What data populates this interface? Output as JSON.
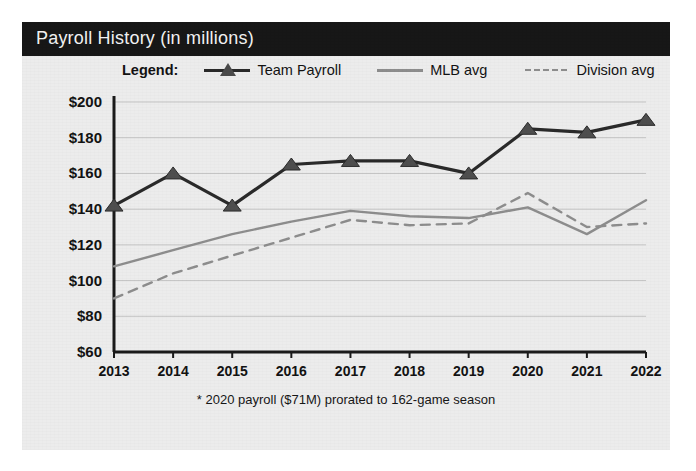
{
  "panel": {
    "title": "Payroll History (in millions)",
    "background_color": "#ececec",
    "title_bar_color": "#171717",
    "title_text_color": "#f2f2f2"
  },
  "legend": {
    "label": "Legend:",
    "items": [
      {
        "name": "Team Payroll",
        "style": "solid-marker",
        "color": "#2a2a2a",
        "marker": "triangle"
      },
      {
        "name": "MLB avg",
        "style": "solid",
        "color": "#8d8d8d",
        "marker": "none"
      },
      {
        "name": "Division avg",
        "style": "dashed",
        "color": "#8d8d8d",
        "marker": "none"
      }
    ]
  },
  "footnote": "* 2020 payroll ($71M) prorated to 162-game season",
  "chart_data": {
    "type": "line",
    "title": "Payroll History (in millions)",
    "xlabel": "",
    "ylabel": "",
    "x": [
      2013,
      2014,
      2015,
      2016,
      2017,
      2018,
      2019,
      2020,
      2021,
      2022
    ],
    "categories": [
      "2013",
      "2014",
      "2015",
      "2016",
      "2017",
      "2018",
      "2019",
      "2020",
      "2021",
      "2022"
    ],
    "ylim": [
      60,
      200
    ],
    "ytick_values": [
      60,
      80,
      100,
      120,
      140,
      160,
      180,
      200
    ],
    "ytick_labels": [
      "$60",
      "$80",
      "$100",
      "$120",
      "$140",
      "$160",
      "$180",
      "$200"
    ],
    "grid": true,
    "legend_position": "top",
    "series": [
      {
        "name": "Team Payroll",
        "color": "#2a2a2a",
        "style": "solid",
        "marker": "triangle",
        "values": [
          142,
          160,
          142,
          165,
          167,
          167,
          160,
          185,
          183,
          190
        ]
      },
      {
        "name": "MLB avg",
        "color": "#8d8d8d",
        "style": "solid",
        "marker": "none",
        "values": [
          108,
          117,
          126,
          133,
          139,
          136,
          135,
          141,
          126,
          145
        ]
      },
      {
        "name": "Division avg",
        "color": "#8d8d8d",
        "style": "dashed",
        "marker": "none",
        "values": [
          90,
          104,
          114,
          124,
          134,
          131,
          132,
          149,
          130,
          132
        ]
      }
    ]
  }
}
